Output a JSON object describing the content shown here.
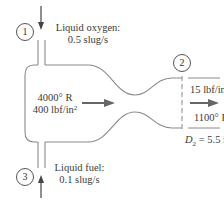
{
  "diagram": {
    "stations": [
      {
        "id": "1",
        "label": "1"
      },
      {
        "id": "2",
        "label": "2"
      },
      {
        "id": "3",
        "label": "3"
      }
    ],
    "inlet_oxygen": {
      "line1": "Liquid oxygen:",
      "line2": "0.5 slug/s"
    },
    "inlet_fuel": {
      "line1": "Liquid fuel:",
      "line2": "0.1 slug/s"
    },
    "chamber": {
      "temperature": "4000° R",
      "pressure_value": "400 lbf/in",
      "pressure_exp": "2"
    },
    "exit": {
      "pressure_value": "15 lbf/in",
      "pressure_exp": "2",
      "temperature": "1100° F",
      "diameter_symbol": "D",
      "diameter_sub": "2",
      "diameter_value": " = 5.5 in"
    },
    "colors": {
      "line": "#888888",
      "arrow": "#666666",
      "text": "#3a3a3a"
    }
  }
}
